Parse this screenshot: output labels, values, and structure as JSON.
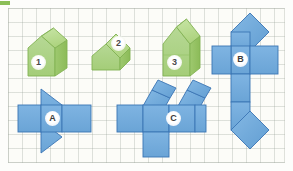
{
  "worksheet": {
    "title": "Solids and nets matching worksheet",
    "background_color": "#fcfcf8",
    "grid_color": "#96a096",
    "solid_fill": "#a9cf7f",
    "solid_fill_dark": "#8cbf58",
    "solid_fill_light": "#c3e09b",
    "solid_stroke": "#7fae4e",
    "net_fill": "#6fa8dc",
    "net_fill_dark": "#5d95c9",
    "net_stroke": "#3b75b4"
  },
  "solids": [
    {
      "id": "solid-1",
      "label": "1",
      "description": "green triangular prism house shape, short",
      "badge": {
        "x": 31,
        "y": 55
      }
    },
    {
      "id": "solid-2",
      "label": "2",
      "description": "green triangular prism lying tilted",
      "badge": {
        "x": 111,
        "y": 36
      }
    },
    {
      "id": "solid-3",
      "label": "3",
      "description": "green triangular prism house shape, tall",
      "badge": {
        "x": 167,
        "y": 55
      }
    }
  ],
  "nets": [
    {
      "id": "net-a",
      "label": "A",
      "description": "net of a triangular prism: horizontal band of three rectangles with two triangles attached above and below",
      "badge": {
        "x": 45,
        "y": 113
      }
    },
    {
      "id": "net-b",
      "label": "B",
      "description": "net arranged as a vertical column of squares with a horizontal pair of squares and two rotated diamond squares",
      "badge": {
        "x": 241,
        "y": 55
      }
    },
    {
      "id": "net-c",
      "label": "C",
      "description": "net with horizontal band of squares, one square below and two tilted rectangular flaps above",
      "badge": {
        "x": 166,
        "y": 113
      }
    }
  ]
}
